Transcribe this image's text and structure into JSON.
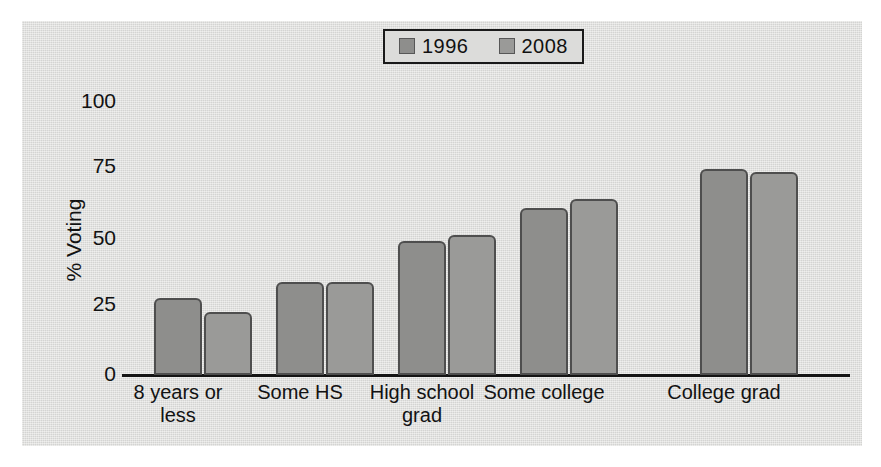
{
  "chart_data": {
    "type": "bar",
    "title": "",
    "xlabel": "",
    "ylabel": "% Voting",
    "ylim": [
      0,
      100
    ],
    "yticks": [
      0,
      25,
      50,
      75,
      100
    ],
    "ytick_labels": [
      "0",
      "25",
      "50",
      "75",
      "100"
    ],
    "grid": false,
    "legend_position": "top-center",
    "categories": [
      "8 years or less",
      "Some HS",
      "High school grad",
      "Some college",
      "College grad"
    ],
    "category_lines": [
      [
        "8 years or",
        "less"
      ],
      [
        "Some HS",
        ""
      ],
      [
        "High school",
        "grad"
      ],
      [
        "Some college",
        ""
      ],
      [
        "College grad",
        ""
      ]
    ],
    "series": [
      {
        "name": "1996",
        "color": "#8e8e8c",
        "values": [
          28,
          34,
          49,
          61,
          75
        ]
      },
      {
        "name": "2008",
        "color": "#9a9a98",
        "values": [
          23,
          34,
          51,
          64,
          74
        ]
      }
    ]
  },
  "legend": {
    "entries": [
      {
        "label": "1996",
        "color": "#8e8e8c"
      },
      {
        "label": "2008",
        "color": "#9a9a98"
      }
    ]
  },
  "axes": {
    "y_label": "% Voting",
    "y_ticks": [
      "100",
      "75",
      "50",
      "25",
      "0"
    ],
    "x_tick_1_line1": "8 years or",
    "x_tick_1_line2": "less",
    "x_tick_2_line1": "Some HS",
    "x_tick_2_line2": "",
    "x_tick_3_line1": "High school",
    "x_tick_3_line2": "grad",
    "x_tick_4_line1": "Some college",
    "x_tick_4_line2": "",
    "x_tick_5_line1": "College grad",
    "x_tick_5_line2": ""
  },
  "colors": {
    "panel_background": "#dcdcda",
    "axis": "#141414",
    "bar_outline": "#4e4e4e",
    "text": "#121212"
  }
}
